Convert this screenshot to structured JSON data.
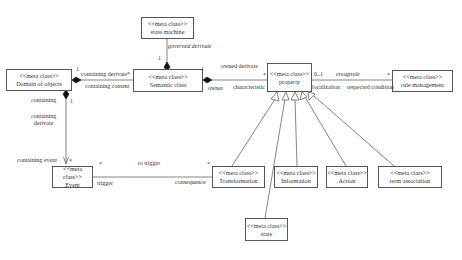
{
  "diagram": {
    "type": "UML class diagram",
    "stereotype": "<<meta class>>",
    "classes": [
      {
        "id": "state_machine",
        "stereotype": "<<meta class>>",
        "name": "state machine"
      },
      {
        "id": "domain",
        "stereotype": "<<meta class>>",
        "name": "Domain of objects"
      },
      {
        "id": "semantic",
        "stereotype": "<<meta class>>",
        "name": "Semantic class"
      },
      {
        "id": "property",
        "stereotype": "<<meta class>>",
        "name": "property"
      },
      {
        "id": "rule",
        "stereotype": "<<meta class>>",
        "name": "rule management"
      },
      {
        "id": "event",
        "stereotype": "<<meta class>>",
        "name": "Event"
      },
      {
        "id": "transformation",
        "stereotype": "<<meta class>>",
        "name": "Transformation"
      },
      {
        "id": "information",
        "stereotype": "<<meta class>>",
        "name": "Information"
      },
      {
        "id": "action",
        "stereotype": "<<meta class>>",
        "name": "Action"
      },
      {
        "id": "term",
        "stereotype": "<<meta class>>",
        "name": "term association"
      },
      {
        "id": "state",
        "stereotype": "<<meta class>>",
        "name": "state"
      }
    ],
    "labels": {
      "governed_derivate": "governed derivate",
      "sm_mult": "1",
      "containing_derivate_top": "containing derivate",
      "containing_derivate_star": "*",
      "containing_content": "containing content",
      "domain_mult_1": "1",
      "owned_derivate": "owned derivate",
      "owner": "owner",
      "semantic_mult_1": "1",
      "characteristic": "characteristic",
      "property_star": "*",
      "property_mult": "0..1",
      "encapsule": "encapsule",
      "localization": "localization",
      "respected_condition": "respected condition",
      "rule_star": "*",
      "containing": "containing",
      "domain_down_mult": "1",
      "containing_derivate_v": "containing\nderivate",
      "containing_event": "containing event",
      "event_star": "*",
      "event_right_star": "*",
      "to_trigger": "to trigger",
      "trigger": "trigger",
      "consequence": "consequence",
      "transformation_star": "*"
    },
    "relations": [
      {
        "from": "state_machine",
        "to": "semantic",
        "kind": "composition",
        "label": "governed derivate"
      },
      {
        "from": "domain",
        "to": "semantic",
        "kind": "composition",
        "roles": [
          "containing derivate",
          "containing content"
        ]
      },
      {
        "from": "semantic",
        "to": "property",
        "kind": "composition",
        "roles": [
          "owned derivate",
          "owner",
          "characteristic"
        ]
      },
      {
        "from": "property",
        "to": "rule",
        "kind": "association",
        "roles": [
          "encapsule",
          "localization",
          "respected condition"
        ]
      },
      {
        "from": "domain",
        "to": "event",
        "kind": "composition",
        "roles": [
          "containing",
          "containing derivate",
          "containing event"
        ]
      },
      {
        "from": "event",
        "to": "transformation",
        "kind": "association",
        "roles": [
          "to trigger",
          "trigger",
          "consequence"
        ]
      },
      {
        "from": "transformation",
        "to": "property",
        "kind": "generalization"
      },
      {
        "from": "state",
        "to": "property",
        "kind": "generalization"
      },
      {
        "from": "information",
        "to": "property",
        "kind": "generalization"
      },
      {
        "from": "action",
        "to": "property",
        "kind": "generalization"
      },
      {
        "from": "term",
        "to": "property",
        "kind": "generalization"
      }
    ]
  }
}
